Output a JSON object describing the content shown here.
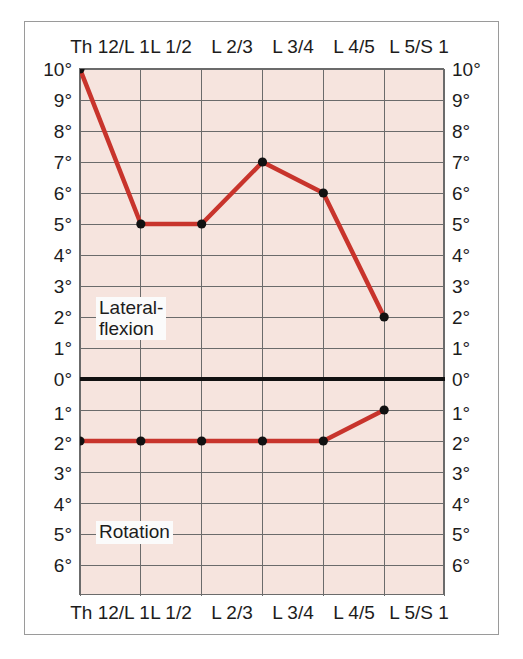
{
  "chart_data": {
    "type": "line",
    "title": "",
    "subtitle": "",
    "xlabel": "",
    "ylabel": "",
    "grid": true,
    "legend_position": "in-plot",
    "categories": [
      "Th 12/L 1",
      "L 1/2",
      "L 2/3",
      "L 3/4",
      "L 4/5",
      "L 5/S 1"
    ],
    "x_axis_top_ticks": [
      "Th 12/L 1",
      "L 1/2",
      "L 2/3",
      "L 3/4",
      "L 4/5",
      "L 5/S 1"
    ],
    "x_axis_bottom_ticks": [
      "Th 12/L 1",
      "L 1/2",
      "L 2/3",
      "L 3/4",
      "L 4/5",
      "L 5/S 1"
    ],
    "y_axis_upper_ticks": [
      "10°",
      "9°",
      "8°",
      "7°",
      "6°",
      "5°",
      "4°",
      "3°",
      "2°",
      "1°",
      "0°"
    ],
    "y_axis_lower_ticks": [
      "0°",
      "1°",
      "2°",
      "3°",
      "4°",
      "5°",
      "6°"
    ],
    "y_upper_max": 10,
    "y_lower_max": 6,
    "zero_line_label": "0°",
    "series": [
      {
        "name": "Lateral-flexion",
        "label": "Lateral-\nflexion",
        "color": "#c8342c",
        "direction": "up",
        "values": [
          10,
          5,
          5,
          7,
          6,
          2
        ],
        "units": "degrees"
      },
      {
        "name": "Rotation",
        "label": "Rotation",
        "color": "#c8342c",
        "direction": "down",
        "values": [
          2,
          2,
          2,
          2,
          2,
          1
        ],
        "units": "degrees"
      }
    ],
    "colors": {
      "line": "#c8342c",
      "marker": "#111111",
      "plot_background": "#f6e4de",
      "gridline": "#6b6b6b",
      "zero_line": "#111111",
      "frame": "#9a9a9a",
      "text": "#1c1c1c"
    }
  },
  "axes": {
    "left_ticks": [
      {
        "label": "10°",
        "top": 60
      },
      {
        "label": "9°",
        "top": 91
      },
      {
        "label": "8°",
        "top": 122
      },
      {
        "label": "7°",
        "top": 153
      },
      {
        "label": "6°",
        "top": 184
      },
      {
        "label": "5°",
        "top": 215
      },
      {
        "label": "4°",
        "top": 246
      },
      {
        "label": "3°",
        "top": 277
      },
      {
        "label": "2°",
        "top": 308
      },
      {
        "label": "1°",
        "top": 339
      },
      {
        "label": "0°",
        "top": 370
      },
      {
        "label": "1°",
        "top": 413
      },
      {
        "label": "2°",
        "top": 434
      },
      {
        "label": "3°",
        "top": 464
      },
      {
        "label": "4°",
        "top": 494
      },
      {
        "label": "5°",
        "top": 525
      },
      {
        "label": "6°",
        "top": 556
      }
    ]
  },
  "labels": {
    "lateral_flexion": "Lateral-\nflexion",
    "rotation": "Rotation"
  }
}
